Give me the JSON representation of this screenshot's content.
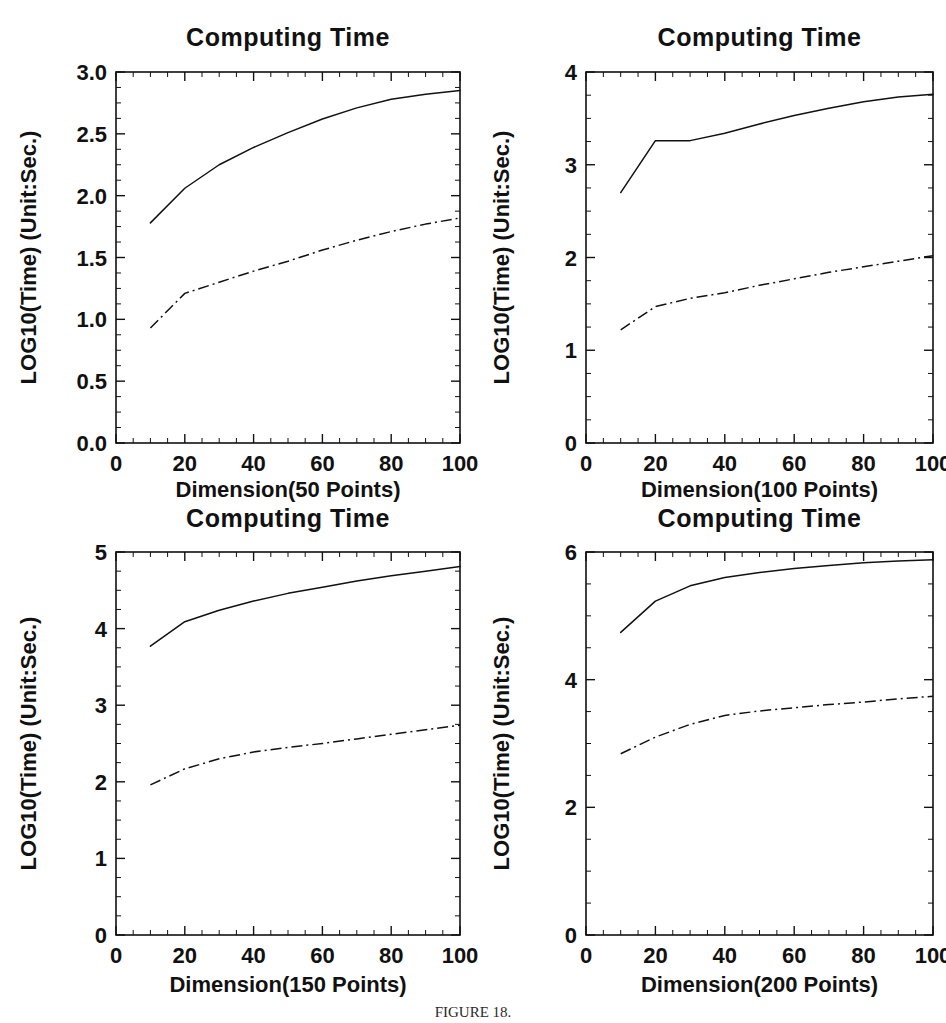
{
  "figure": {
    "caption": "FIGURE 18.",
    "caption_visible": true
  },
  "panels": [
    {
      "id": "top-left",
      "title": "Computing Time",
      "xlabel": "Dimension(50 Points)",
      "ylabel": "LOG10(Time) (Unit:Sec.)",
      "xticks": [
        "0",
        "20",
        "40",
        "60",
        "80",
        "100"
      ],
      "yticks": [
        "0.0",
        "0.5",
        "1.0",
        "1.5",
        "2.0",
        "2.5",
        "3.0"
      ]
    },
    {
      "id": "top-right",
      "title": "Computing Time",
      "xlabel": "Dimension(100 Points)",
      "ylabel": "LOG10(Time) (Unit:Sec.)",
      "xticks": [
        "0",
        "20",
        "40",
        "60",
        "80",
        "100"
      ],
      "yticks": [
        "0",
        "1",
        "2",
        "3",
        "4"
      ]
    },
    {
      "id": "bottom-left",
      "title": "Computing Time",
      "xlabel": "Dimension(150 Points)",
      "ylabel": "LOG10(Time) (Unit:Sec.)",
      "xticks": [
        "0",
        "20",
        "40",
        "60",
        "80",
        "100"
      ],
      "yticks": [
        "0",
        "1",
        "2",
        "3",
        "4",
        "5"
      ]
    },
    {
      "id": "bottom-right",
      "title": "Computing Time",
      "xlabel": "Dimension(200 Points)",
      "ylabel": "LOG10(Time) (Unit:Sec.)",
      "xticks": [
        "0",
        "20",
        "40",
        "60",
        "80",
        "100"
      ],
      "yticks": [
        "0",
        "2",
        "4",
        "6"
      ]
    }
  ],
  "chart_data": [
    {
      "type": "line",
      "panel": "top-left",
      "title": "Computing Time",
      "xlabel": "Dimension(50 Points)",
      "ylabel": "LOG10(Time) (Unit:Sec.)",
      "xlim": [
        0,
        100
      ],
      "ylim": [
        0.0,
        3.0
      ],
      "xticks": [
        0,
        20,
        40,
        60,
        80,
        100
      ],
      "yticks": [
        0.0,
        0.5,
        1.0,
        1.5,
        2.0,
        2.5,
        3.0
      ],
      "minor_ticks": true,
      "grid": false,
      "legend": "none",
      "x": [
        10,
        20,
        30,
        40,
        50,
        60,
        70,
        80,
        90,
        100
      ],
      "series": [
        {
          "name": "upper-solid",
          "style": "solid",
          "values": [
            1.78,
            2.06,
            2.25,
            2.39,
            2.51,
            2.62,
            2.71,
            2.78,
            2.82,
            2.85
          ]
        },
        {
          "name": "lower-dash-dot",
          "style": "dash-dot",
          "values": [
            0.93,
            1.21,
            1.3,
            1.39,
            1.47,
            1.56,
            1.64,
            1.71,
            1.77,
            1.82
          ]
        }
      ]
    },
    {
      "type": "line",
      "panel": "top-right",
      "title": "Computing Time",
      "xlabel": "Dimension(100 Points)",
      "ylabel": "LOG10(Time) (Unit:Sec.)",
      "xlim": [
        0,
        100
      ],
      "ylim": [
        0,
        4
      ],
      "xticks": [
        0,
        20,
        40,
        60,
        80,
        100
      ],
      "yticks": [
        0,
        1,
        2,
        3,
        4
      ],
      "minor_ticks": true,
      "grid": false,
      "legend": "none",
      "x": [
        10,
        20,
        30,
        40,
        50,
        60,
        70,
        80,
        90,
        100
      ],
      "series": [
        {
          "name": "upper-solid",
          "style": "solid",
          "values": [
            2.7,
            3.26,
            3.26,
            3.34,
            3.44,
            3.53,
            3.61,
            3.68,
            3.73,
            3.76
          ]
        },
        {
          "name": "lower-dash-dot",
          "style": "dash-dot",
          "values": [
            1.22,
            1.47,
            1.56,
            1.62,
            1.7,
            1.77,
            1.84,
            1.9,
            1.96,
            2.02
          ]
        }
      ]
    },
    {
      "type": "line",
      "panel": "bottom-left",
      "title": "Computing Time",
      "xlabel": "Dimension(150 Points)",
      "ylabel": "LOG10(Time) (Unit:Sec.)",
      "xlim": [
        0,
        100
      ],
      "ylim": [
        0,
        5
      ],
      "xticks": [
        0,
        20,
        40,
        60,
        80,
        100
      ],
      "yticks": [
        0,
        1,
        2,
        3,
        4,
        5
      ],
      "minor_ticks": true,
      "grid": false,
      "legend": "none",
      "x": [
        10,
        20,
        30,
        40,
        50,
        60,
        70,
        80,
        90,
        100
      ],
      "series": [
        {
          "name": "upper-solid",
          "style": "solid",
          "values": [
            3.77,
            4.09,
            4.24,
            4.36,
            4.46,
            4.54,
            4.62,
            4.69,
            4.75,
            4.81
          ]
        },
        {
          "name": "lower-dash-dot",
          "style": "dash-dot",
          "values": [
            1.96,
            2.17,
            2.3,
            2.39,
            2.45,
            2.5,
            2.56,
            2.62,
            2.68,
            2.74
          ]
        }
      ]
    },
    {
      "type": "line",
      "panel": "bottom-right",
      "title": "Computing Time",
      "xlabel": "Dimension(200 Points)",
      "ylabel": "LOG10(Time) (Unit:Sec.)",
      "xlim": [
        0,
        100
      ],
      "ylim": [
        0,
        6
      ],
      "xticks": [
        0,
        20,
        40,
        60,
        80,
        100
      ],
      "yticks": [
        0,
        2,
        4,
        6
      ],
      "minor_ticks": true,
      "grid": false,
      "legend": "none",
      "x": [
        10,
        20,
        30,
        40,
        50,
        60,
        70,
        80,
        90,
        100
      ],
      "series": [
        {
          "name": "upper-solid",
          "style": "solid",
          "values": [
            4.74,
            5.23,
            5.47,
            5.6,
            5.68,
            5.74,
            5.79,
            5.83,
            5.86,
            5.88
          ]
        },
        {
          "name": "lower-dash-dot",
          "style": "dash-dot",
          "values": [
            2.84,
            3.1,
            3.3,
            3.44,
            3.51,
            3.56,
            3.61,
            3.65,
            3.7,
            3.74
          ]
        }
      ]
    }
  ]
}
